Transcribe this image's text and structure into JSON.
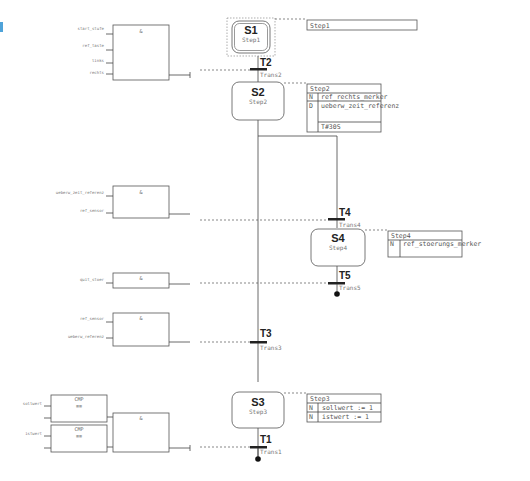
{
  "accent_color": "#4fa3d9",
  "steps": [
    {
      "id": "S1",
      "name": "Step1",
      "initial": true
    },
    {
      "id": "S2",
      "name": "Step2",
      "initial": false
    },
    {
      "id": "S4",
      "name": "Step4",
      "initial": false
    },
    {
      "id": "S3",
      "name": "Step3",
      "initial": false
    }
  ],
  "transitions": [
    {
      "id": "T2",
      "name": "Trans2"
    },
    {
      "id": "T4",
      "name": "Trans4"
    },
    {
      "id": "T5",
      "name": "Trans5"
    },
    {
      "id": "T3",
      "name": "Trans3"
    },
    {
      "id": "T1",
      "name": "Trans1"
    }
  ],
  "action_blocks": {
    "s1": {
      "header": "Step1"
    },
    "s2": {
      "header": "Step2",
      "rows": [
        {
          "qualifier": "N",
          "action": "ref_rechts_merker"
        },
        {
          "qualifier": "D",
          "action": "ueberw_zeit_referenz"
        },
        {
          "qualifier": "",
          "action": "T#30S"
        }
      ]
    },
    "s4": {
      "header": "Step4",
      "rows": [
        {
          "qualifier": "N",
          "action": "ref_stoerungs_merker"
        }
      ]
    },
    "s3": {
      "header": "Step3",
      "rows": [
        {
          "qualifier": "N",
          "action": "sollwert := 1"
        },
        {
          "qualifier": "N",
          "action": "istwert := 1"
        }
      ]
    }
  },
  "fbd": {
    "t2": {
      "op": "&",
      "inputs": [
        "start_stufe",
        "ref_taste",
        "links",
        "rechts"
      ]
    },
    "t4": {
      "op": "&",
      "inputs": [
        "ueberw_zeit_referenz",
        "ref_sensor"
      ]
    },
    "t5": {
      "op": "&",
      "inputs": [
        "quit_stoer"
      ]
    },
    "t3": {
      "op": "&",
      "inputs": [
        "ref_sensor",
        "ueberw_referenz"
      ]
    },
    "t1": {
      "op": "&",
      "cmp1": {
        "op": "CMP",
        "sym": "==",
        "in": "sollwert"
      },
      "cmp2": {
        "op": "CMP",
        "sym": "==",
        "in": "istwert"
      }
    }
  }
}
